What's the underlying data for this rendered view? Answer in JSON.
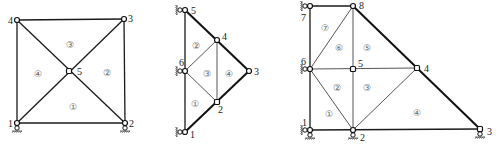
{
  "figures": [
    {
      "id": "fig-a",
      "nodes": [
        {
          "id": "1",
          "x": 17,
          "y": 123,
          "label": "1"
        },
        {
          "id": "2",
          "x": 125,
          "y": 123,
          "label": "2"
        },
        {
          "id": "3",
          "x": 124,
          "y": 19,
          "label": "3"
        },
        {
          "id": "4",
          "x": 17,
          "y": 20,
          "label": "4"
        },
        {
          "id": "5",
          "x": 69,
          "y": 71,
          "label": "5"
        }
      ],
      "elements": [
        {
          "label": "①",
          "x": 74,
          "y": 107
        },
        {
          "label": "②",
          "x": 108,
          "y": 73
        },
        {
          "label": "③",
          "x": 71,
          "y": 45
        },
        {
          "label": "④",
          "x": 39,
          "y": 74
        }
      ]
    },
    {
      "id": "fig-b",
      "nodes": [
        {
          "id": "1",
          "x": 185,
          "y": 132,
          "label": "1"
        },
        {
          "id": "2",
          "x": 217,
          "y": 102,
          "label": "2"
        },
        {
          "id": "3",
          "x": 249,
          "y": 71,
          "label": "3"
        },
        {
          "id": "4",
          "x": 217,
          "y": 40,
          "label": "4"
        },
        {
          "id": "5",
          "x": 185,
          "y": 10,
          "label": "5"
        },
        {
          "id": "6",
          "x": 185,
          "y": 71,
          "label": "6"
        }
      ],
      "elements": [
        {
          "label": "①",
          "x": 196,
          "y": 104
        },
        {
          "label": "②",
          "x": 197,
          "y": 46
        },
        {
          "label": "③",
          "x": 208,
          "y": 74
        },
        {
          "label": "④",
          "x": 230,
          "y": 74
        }
      ]
    },
    {
      "id": "fig-c",
      "nodes": [
        {
          "id": "1",
          "x": 310,
          "y": 130,
          "label": "1"
        },
        {
          "id": "2",
          "x": 353,
          "y": 130,
          "label": "2"
        },
        {
          "id": "3",
          "x": 480,
          "y": 129,
          "label": "3"
        },
        {
          "id": "4",
          "x": 417,
          "y": 68,
          "label": "4"
        },
        {
          "id": "5",
          "x": 353,
          "y": 69,
          "label": "5"
        },
        {
          "id": "6",
          "x": 310,
          "y": 69,
          "label": "6"
        },
        {
          "id": "7",
          "x": 310,
          "y": 6,
          "label": "7"
        },
        {
          "id": "8",
          "x": 353,
          "y": 6,
          "label": "8"
        }
      ],
      "elements": [
        {
          "label": "①",
          "x": 330,
          "y": 114
        },
        {
          "label": "②",
          "x": 338,
          "y": 88
        },
        {
          "label": "③",
          "x": 368,
          "y": 88
        },
        {
          "label": "④",
          "x": 418,
          "y": 113
        },
        {
          "label": "⑤",
          "x": 368,
          "y": 48
        },
        {
          "label": "⑥",
          "x": 340,
          "y": 48
        },
        {
          "label": "⑦",
          "x": 326,
          "y": 28
        }
      ]
    }
  ]
}
